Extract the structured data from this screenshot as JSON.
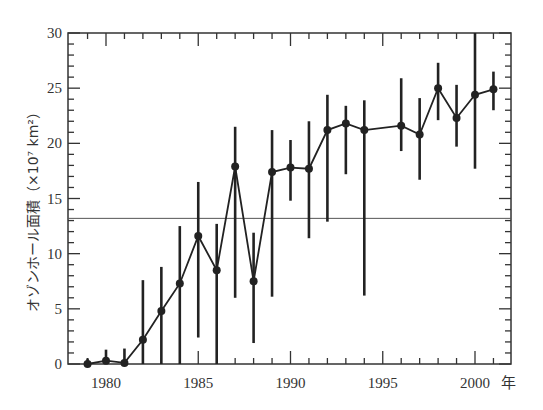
{
  "chart_data": {
    "type": "line",
    "title": "",
    "xlabel": "年",
    "ylabel": "オゾンホール面積（×10⁷ km²）",
    "ylim": [
      0,
      30
    ],
    "xlim": [
      1978.3,
      2002.3
    ],
    "x_ticks": [
      1980,
      1985,
      1990,
      1995,
      2000
    ],
    "x_tick_labels": [
      "1980",
      "1985",
      "1990",
      "1995",
      "2000"
    ],
    "y_ticks": [
      0,
      5,
      10,
      15,
      20,
      25,
      30
    ],
    "y_tick_labels": [
      "0",
      "5",
      "10",
      "15",
      "20",
      "25",
      "30"
    ],
    "reference_line": 13.2,
    "grid": false,
    "series": [
      {
        "name": "オゾンホール面積",
        "x": [
          1979,
          1980,
          1981,
          1982,
          1983,
          1984,
          1985,
          1986,
          1987,
          1988,
          1989,
          1990,
          1991,
          1992,
          1993,
          1994,
          1996,
          1997,
          1998,
          1999,
          2000,
          2001
        ],
        "values": [
          0,
          0.3,
          0.1,
          2.2,
          4.8,
          7.3,
          11.6,
          8.5,
          17.9,
          7.5,
          17.4,
          17.8,
          17.7,
          21.2,
          21.8,
          21.2,
          21.6,
          20.8,
          25.0,
          22.3,
          24.4,
          24.9
        ],
        "err_low": [
          0,
          0,
          0,
          0,
          0,
          0,
          2.4,
          0,
          6.0,
          1.9,
          6.1,
          14.8,
          11.4,
          12.9,
          17.2,
          6.2,
          19.3,
          16.7,
          22.1,
          19.7,
          17.7,
          23.0
        ],
        "err_high": [
          0.5,
          1.3,
          1.4,
          7.6,
          8.8,
          12.5,
          16.5,
          12.7,
          21.5,
          11.9,
          21.2,
          20.3,
          22.0,
          24.4,
          23.4,
          23.9,
          25.9,
          24.1,
          27.3,
          25.3,
          30.0,
          26.5
        ]
      }
    ]
  }
}
